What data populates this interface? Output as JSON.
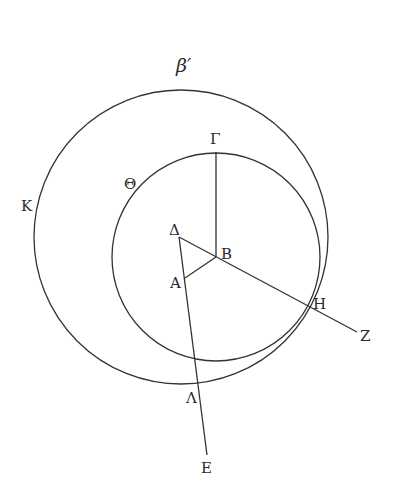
{
  "title": "β′",
  "colors": {
    "stroke": "#333333",
    "text": "#2a2a2a",
    "background": "#ffffff"
  },
  "labels": {
    "gamma": "Γ",
    "theta": "Θ",
    "kappa": "Κ",
    "delta": "Δ",
    "beta": "Β",
    "alpha": "Α",
    "eta": "Η",
    "zeta": "Ζ",
    "lambda": "Λ",
    "epsilon": "Ε"
  },
  "geometry": {
    "outer_circle": {
      "label": "Κ",
      "cx": 181,
      "cy": 237,
      "r": 147
    },
    "inner_circle": {
      "label": "Θ",
      "center": "Β",
      "cx": 216,
      "cy": 257,
      "r": 104
    },
    "points": {
      "Δ": [
        179,
        237
      ],
      "Β": [
        216,
        257
      ],
      "Α": [
        185,
        278
      ],
      "Γ": [
        216,
        152
      ],
      "Η": [
        307,
        305
      ],
      "Ζ": [
        357,
        332
      ],
      "Λ": [
        196,
        385
      ],
      "Ε": [
        207,
        455
      ]
    },
    "segments": [
      [
        "Β",
        "Γ"
      ],
      [
        "Δ",
        "Ζ"
      ],
      [
        "Α",
        "Β"
      ],
      [
        "Δ",
        "Ε"
      ]
    ]
  }
}
